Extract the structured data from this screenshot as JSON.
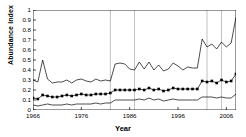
{
  "chart_data": {
    "type": "line",
    "title": "",
    "xlabel": "Year",
    "ylabel": "Abundance index",
    "xlim": [
      1966,
      2008
    ],
    "ylim": [
      0,
      1
    ],
    "grid": "vertical-reference-lines-only",
    "legend": "none",
    "ytick_labels": [
      "0",
      "0.1",
      "0.2",
      "0.3",
      "0.4",
      "0.5",
      "0.6",
      "0.7",
      "0.8",
      "0.9",
      "1"
    ],
    "ytick_values": [
      0,
      0.1,
      0.2,
      0.3,
      0.4,
      0.5,
      0.6,
      0.7,
      0.8,
      0.9,
      1
    ],
    "xtick_labels": [
      "1966",
      "1976",
      "1986",
      "1996",
      "2006"
    ],
    "xtick_values": [
      1966,
      1976,
      1986,
      1996,
      2006
    ],
    "vertical_reference_lines": [
      1982,
      1987,
      2002,
      2005
    ],
    "x": [
      1966,
      1967,
      1968,
      1969,
      1970,
      1971,
      1972,
      1973,
      1974,
      1975,
      1976,
      1977,
      1978,
      1979,
      1980,
      1981,
      1982,
      1983,
      1984,
      1985,
      1986,
      1987,
      1988,
      1989,
      1990,
      1991,
      1992,
      1993,
      1994,
      1995,
      1996,
      1997,
      1998,
      1999,
      2000,
      2001,
      2002,
      2003,
      2004,
      2005,
      2006,
      2007,
      2008
    ],
    "series": [
      {
        "name": "Upper confidence bound",
        "style": "thin-line-no-markers",
        "color": "#000000",
        "values": [
          0.3,
          0.28,
          0.5,
          0.31,
          0.27,
          0.28,
          0.28,
          0.3,
          0.27,
          0.3,
          0.31,
          0.29,
          0.28,
          0.31,
          0.29,
          0.3,
          0.29,
          0.46,
          0.47,
          0.46,
          0.41,
          0.4,
          0.48,
          0.41,
          0.48,
          0.4,
          0.45,
          0.39,
          0.41,
          0.47,
          0.44,
          0.4,
          0.43,
          0.42,
          0.42,
          0.71,
          0.63,
          0.66,
          0.61,
          0.68,
          0.63,
          0.67,
          0.93
        ]
      },
      {
        "name": "Abundance index (mean)",
        "style": "line-with-square-markers",
        "color": "#000000",
        "values": [
          0.12,
          0.11,
          0.15,
          0.14,
          0.13,
          0.13,
          0.14,
          0.15,
          0.14,
          0.15,
          0.16,
          0.15,
          0.15,
          0.16,
          0.16,
          0.16,
          0.17,
          0.2,
          0.2,
          0.2,
          0.2,
          0.2,
          0.21,
          0.2,
          0.22,
          0.2,
          0.21,
          0.19,
          0.2,
          0.22,
          0.21,
          0.21,
          0.21,
          0.21,
          0.21,
          0.29,
          0.28,
          0.29,
          0.27,
          0.3,
          0.28,
          0.29,
          0.36
        ]
      },
      {
        "name": "Lower confidence bound",
        "style": "thin-line-no-markers",
        "color": "#000000",
        "values": [
          0.05,
          0.04,
          0.05,
          0.06,
          0.05,
          0.05,
          0.05,
          0.06,
          0.05,
          0.06,
          0.06,
          0.06,
          0.06,
          0.07,
          0.06,
          0.07,
          0.07,
          0.1,
          0.1,
          0.1,
          0.1,
          0.1,
          0.11,
          0.1,
          0.12,
          0.1,
          0.11,
          0.09,
          0.1,
          0.11,
          0.1,
          0.1,
          0.1,
          0.1,
          0.1,
          0.13,
          0.13,
          0.13,
          0.12,
          0.13,
          0.12,
          0.12,
          0.16
        ]
      }
    ]
  }
}
